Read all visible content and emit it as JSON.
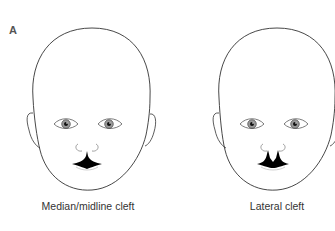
{
  "figure": {
    "panel_label": "A",
    "faces": [
      {
        "id": "median",
        "caption": "Median/midline cleft",
        "cleft_type": "median"
      },
      {
        "id": "lateral",
        "caption": "Lateral cleft",
        "cleft_type": "lateral"
      }
    ],
    "colors": {
      "outline": "#333333",
      "fill": "#000000",
      "background": "#ffffff",
      "text": "#333333"
    }
  }
}
